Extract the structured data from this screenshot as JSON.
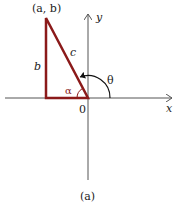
{
  "diagram": {
    "caption": "(a)",
    "point_label": "(a, b)",
    "x_axis_label": "x",
    "y_axis_label": "y",
    "origin_label": "0",
    "hypotenuse_label": "c",
    "side_label": "b",
    "reference_angle_label": "α",
    "angle_label": "θ",
    "colors": {
      "triangle": "#8b1a1a",
      "axes": "#555555",
      "text": "#222222"
    }
  }
}
